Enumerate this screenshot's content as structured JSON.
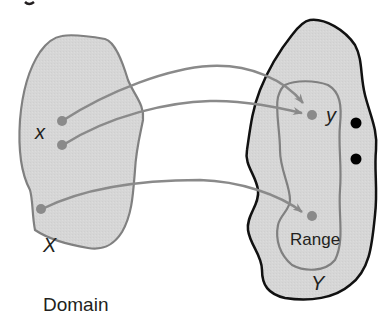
{
  "diagram": {
    "domain_set": {
      "label": "X",
      "caption": "Domain",
      "element_label": "x",
      "fill": "#d9d9d9",
      "stroke": "#808080"
    },
    "codomain_set": {
      "label": "Y",
      "fill": "#d9d9d9",
      "stroke": "#111111",
      "element_label": "y"
    },
    "range_subset": {
      "label": "Range",
      "stroke": "#808080"
    },
    "arrows": [
      {
        "from": "x (upper point)",
        "to": "y"
      },
      {
        "from": "x (lower point)",
        "to": "y"
      },
      {
        "from": "third domain point",
        "to": "range point"
      }
    ],
    "unmapped_points": 2,
    "colors": {
      "arrow": "#8a8a8a",
      "point": "#8a8a8a",
      "unmapped_point": "#000000"
    }
  }
}
